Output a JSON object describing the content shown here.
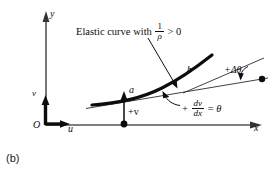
{
  "figure": {
    "caption": "(b)",
    "axes": {
      "y_label": "y",
      "x_label": "x",
      "origin_label": "O",
      "u_label": "u",
      "v_label": "v"
    },
    "points": {
      "a_label": "a",
      "b_label": "b"
    },
    "annotations": {
      "elastic_curve": {
        "prefix": "Elastic curve with",
        "fraction_numerator": "1",
        "fraction_denominator": "ρ",
        "comparison": "> 0"
      },
      "slope": {
        "plus": "+",
        "fraction_numerator": "dv",
        "fraction_denominator": "dx",
        "equals": "=",
        "theta": "θ"
      },
      "delta_theta": "+Δθ",
      "deflection": "+v"
    },
    "colors": {
      "ink": "#0d0d0d",
      "background": "#ffffff",
      "thin_line": "#2b2b2b"
    }
  }
}
